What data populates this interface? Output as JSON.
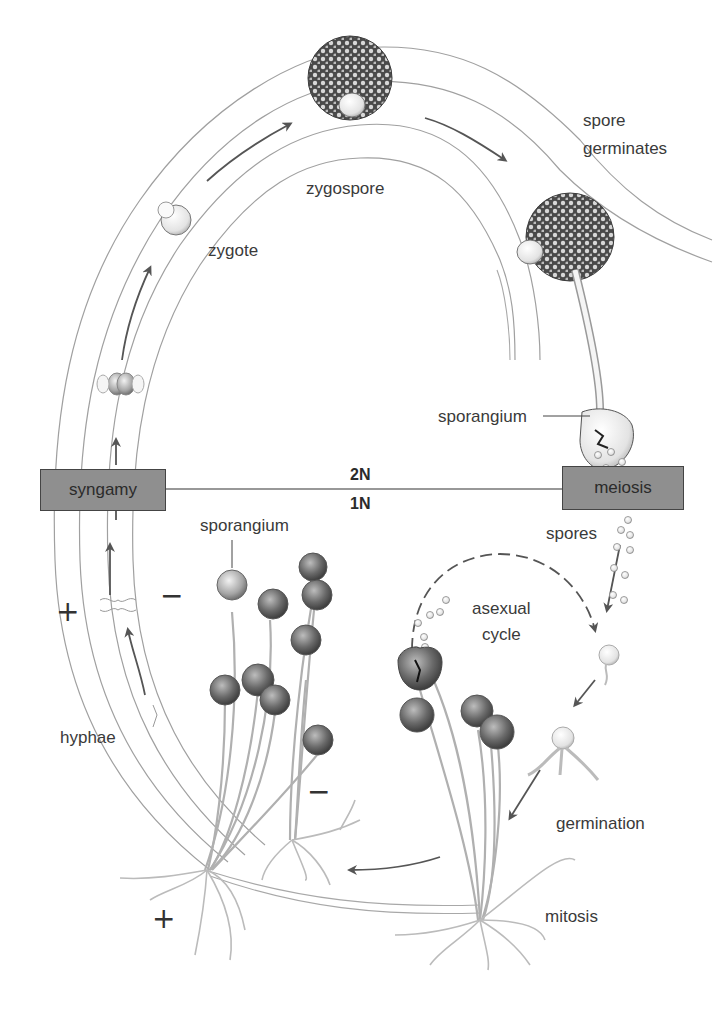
{
  "diagram": {
    "type": "life-cycle",
    "phases": {
      "upper": "2N",
      "lower": "1N"
    },
    "boxes": {
      "syngamy": "syngamy",
      "meiosis": "meiosis"
    },
    "labels": {
      "zygote": "zygote",
      "zygospore": "zygospore",
      "spore_germinates_line1": "spore",
      "spore_germinates_line2": "germinates",
      "sporangium_right": "sporangium",
      "sporangium_left": "sporangium",
      "spores": "spores",
      "asexual_line1": "asexual",
      "asexual_line2": "cycle",
      "hyphae": "hyphae",
      "germination": "germination",
      "mitosis": "mitosis"
    },
    "mating_signs": {
      "plus_left": "+",
      "minus_left": "−",
      "minus_right": "−",
      "plus_bottom": "+"
    },
    "colors": {
      "box_fill": "#8f8f8f",
      "arrow": "#555555",
      "outline": "#9a9a9a",
      "sporangium_dark": "#5a5a5a"
    }
  }
}
